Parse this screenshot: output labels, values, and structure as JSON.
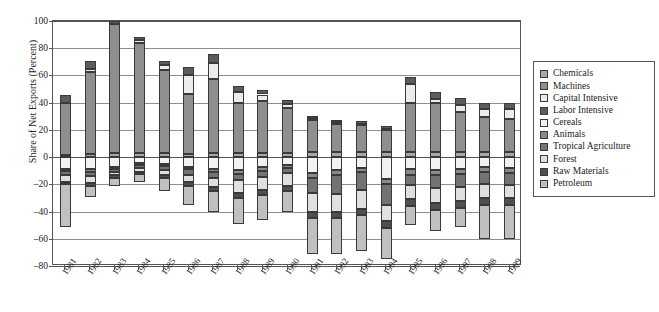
{
  "chart_data": {
    "type": "bar",
    "stacked": true,
    "title": "",
    "xlabel": "",
    "ylabel": "Share of Net Exports (Percent)",
    "ylim": [
      -80,
      100
    ],
    "ytick_values": [
      100,
      80,
      60,
      40,
      20,
      0,
      -20,
      -40,
      -60,
      -80
    ],
    "ytick_labels": [
      "100",
      "80",
      "60",
      "40",
      "20",
      "0",
      "–20",
      "–40",
      "–60",
      "–80"
    ],
    "grid": true,
    "legend_position": "right",
    "categories": [
      "1981",
      "1982",
      "1983",
      "1984",
      "1985",
      "1986",
      "1987",
      "1988",
      "1989",
      "1990",
      "1991",
      "1992",
      "1993",
      "1994",
      "1995",
      "1996",
      "1997",
      "1998",
      "1999"
    ],
    "series": [
      {
        "name": "Chemicals",
        "color": "#a8a8a8",
        "values": [
          1.5,
          2.5,
          3.0,
          3.0,
          3.0,
          2.5,
          3.0,
          3.0,
          3.0,
          3.0,
          3.5,
          3.5,
          3.5,
          3.5,
          4.0,
          4.0,
          4.0,
          4.0,
          4.0
        ]
      },
      {
        "name": "Machines",
        "color": "#8f8f8f",
        "values": [
          38.0,
          60.0,
          95.0,
          81.0,
          61.0,
          44.0,
          54.5,
          37.0,
          38.0,
          33.0,
          23.5,
          21.0,
          20.0,
          16.5,
          36.0,
          36.0,
          29.0,
          25.5,
          24.0
        ]
      },
      {
        "name": "Capital Intensive",
        "color": "#ececec",
        "values": [
          0.0,
          2.5,
          0.0,
          2.0,
          3.5,
          14.0,
          12.0,
          8.0,
          5.0,
          3.0,
          1.5,
          1.0,
          1.0,
          1.0,
          14.0,
          2.5,
          5.5,
          6.0,
          7.0
        ]
      },
      {
        "name": "Labor Intensive",
        "color": "#5c5c5c",
        "values": [
          6.0,
          5.5,
          2.0,
          2.5,
          3.0,
          5.5,
          6.5,
          4.0,
          3.5,
          3.0,
          2.0,
          2.0,
          2.0,
          2.0,
          5.0,
          5.0,
          5.0,
          4.5,
          5.0
        ]
      },
      {
        "name": "Cereals",
        "color": "#f2f2f2",
        "values": [
          -9.0,
          -9.0,
          -7.0,
          -4.0,
          -5.0,
          -7.0,
          -8.5,
          -9.5,
          -7.0,
          -5.5,
          -11.5,
          -9.5,
          -8.0,
          -16.0,
          -9.0,
          -9.5,
          -8.5,
          -7.0,
          -8.0
        ]
      },
      {
        "name": "Animals",
        "color": "#8a8a8a",
        "values": [
          -1.5,
          -2.0,
          -1.5,
          -1.5,
          -1.5,
          -2.0,
          -2.5,
          -3.0,
          -3.0,
          -2.5,
          -3.5,
          -3.5,
          -3.0,
          -4.0,
          -4.0,
          -4.0,
          -4.0,
          -4.0,
          -4.0
        ]
      },
      {
        "name": "Tropical Agriculture",
        "color": "#737373",
        "values": [
          -2.5,
          -3.0,
          -2.5,
          -2.5,
          -3.0,
          -4.0,
          -4.0,
          -4.5,
          -4.5,
          -4.0,
          -11.5,
          -14.0,
          -13.5,
          -15.0,
          -7.5,
          -9.0,
          -9.5,
          -9.0,
          -8.5
        ]
      },
      {
        "name": "Forest",
        "color": "#e0e0e0",
        "values": [
          -5.0,
          -5.0,
          -2.5,
          -3.0,
          -3.5,
          -5.5,
          -7.0,
          -9.5,
          -10.0,
          -9.5,
          -14.0,
          -13.5,
          -13.5,
          -12.0,
          -10.5,
          -11.5,
          -10.5,
          -10.0,
          -9.5
        ]
      },
      {
        "name": "Raw Materials",
        "color": "#4f4f4f",
        "values": [
          -2.0,
          -2.0,
          -1.5,
          -1.5,
          -2.0,
          -2.5,
          -3.0,
          -3.5,
          -3.5,
          -3.5,
          -4.5,
          -4.5,
          -4.5,
          -5.0,
          -5.0,
          -5.0,
          -5.0,
          -5.0,
          -5.0
        ]
      },
      {
        "name": "Petroleum",
        "color": "#c0c0c0",
        "values": [
          -31.0,
          -8.0,
          -6.5,
          -6.0,
          -10.0,
          -14.0,
          -15.0,
          -19.0,
          -18.0,
          -15.5,
          -26.0,
          -26.0,
          -26.5,
          -23.0,
          -14.0,
          -15.0,
          -14.0,
          -25.0,
          -25.0
        ]
      }
    ]
  },
  "legend": {
    "items": [
      {
        "label": "Chemicals"
      },
      {
        "label": "Machines"
      },
      {
        "label": "Capital Intensive"
      },
      {
        "label": "Labor Intensive"
      },
      {
        "label": "Cereals"
      },
      {
        "label": "Animals"
      },
      {
        "label": "Tropical Agriculture"
      },
      {
        "label": "Forest"
      },
      {
        "label": "Raw Materials"
      },
      {
        "label": "Petroleum"
      }
    ]
  }
}
